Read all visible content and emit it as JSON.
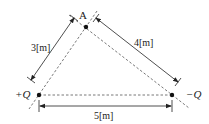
{
  "diagram": {
    "type": "triangle-charges",
    "vertex_label": "A",
    "charges": {
      "positive": "+Q",
      "negative": "−Q"
    },
    "dimensions": {
      "side_left": "3[m]",
      "side_right": "4[m]",
      "side_bottom": "5[m]"
    },
    "colors": {
      "line": "#222222",
      "dashed": "#555555",
      "background": "#ffffff"
    }
  }
}
